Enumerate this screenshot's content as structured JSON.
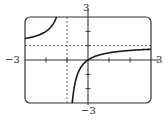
{
  "chart_data": {
    "type": "line",
    "title": "",
    "function": "f(x) = x/(x+1)",
    "xlabel": "",
    "ylabel": "",
    "xlim": [
      -3,
      3
    ],
    "ylim": [
      -3,
      3
    ],
    "x_ticks": [
      -2,
      -1,
      0,
      1,
      2
    ],
    "y_ticks": [
      -2,
      -1,
      0,
      1,
      2
    ],
    "tick_labels": {
      "x_min": "−3",
      "x_max": "3",
      "y_min": "−3",
      "y_max": "3"
    },
    "asymptotes": {
      "vertical": -1,
      "horizontal": 1
    },
    "grid": false,
    "legend": null,
    "series": [
      {
        "name": "left-branch",
        "x": [
          -3,
          -2.5,
          -2,
          -1.75,
          -1.5
        ],
        "y": [
          1.5,
          1.667,
          2,
          2.333,
          3
        ]
      },
      {
        "name": "right-branch",
        "x": [
          -0.75,
          -0.5,
          -0.25,
          0,
          0.5,
          1,
          2,
          3
        ],
        "y": [
          -3,
          -1,
          -0.333,
          0,
          0.333,
          0.5,
          0.667,
          0.75
        ]
      }
    ],
    "colors": {
      "curve": "#1a1a1a",
      "axes": "#333333",
      "frame": "#333333",
      "asymptote": "#555555"
    }
  }
}
